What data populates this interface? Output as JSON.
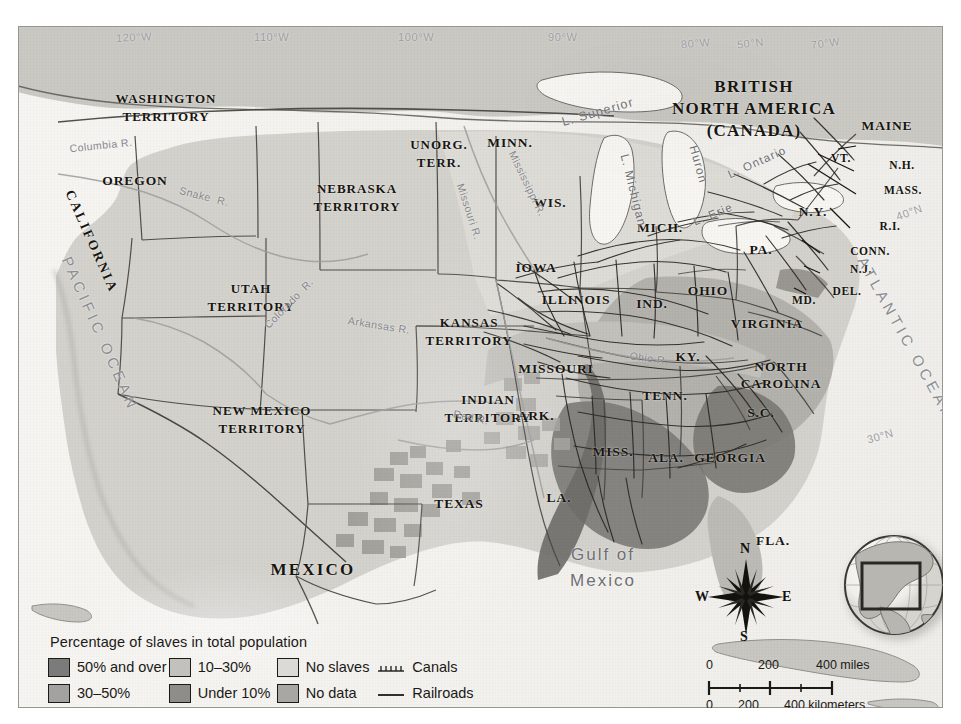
{
  "map": {
    "title": "Percentage of slaves in total population",
    "colors": {
      "over50": "#7b7b7b",
      "p30_50": "#9d9d9d",
      "p10_30": "#b9b9b9",
      "under10": "#8e8e8e",
      "no_slaves": "#d6d5d1",
      "no_data": "#a7a7a7",
      "land": "#cfcdc8",
      "water": "#f4f3f0",
      "ink": "#17150f",
      "border": "#3a3833"
    },
    "regions": [
      {
        "name": "WASHINGTON\nTERRITORY",
        "class": "terr"
      },
      {
        "name": "OREGON",
        "class": "state"
      },
      {
        "name": "CALIFORNIA",
        "class": "state"
      },
      {
        "name": "UTAH\nTERRITORY",
        "class": "terr"
      },
      {
        "name": "NEW MEXICO\nTERRITORY",
        "class": "terr"
      },
      {
        "name": "NEBRASKA\nTERRITORY",
        "class": "terr"
      },
      {
        "name": "KANSAS\nTERRITORY",
        "class": "terr"
      },
      {
        "name": "INDIAN\nTERRITORY",
        "class": "terr"
      },
      {
        "name": "UNORG.\nTERR.",
        "class": "terr"
      },
      {
        "name": "MINN.",
        "class": "state"
      },
      {
        "name": "WIS.",
        "class": "state"
      },
      {
        "name": "IOWA",
        "class": "state"
      },
      {
        "name": "MICH.",
        "class": "state"
      },
      {
        "name": "ILLINOIS",
        "class": "state"
      },
      {
        "name": "IND.",
        "class": "state"
      },
      {
        "name": "OHIO",
        "class": "state"
      },
      {
        "name": "MISSOURI",
        "class": "state"
      },
      {
        "name": "ARK.",
        "class": "state"
      },
      {
        "name": "TEXAS",
        "class": "state"
      },
      {
        "name": "LA.",
        "class": "state"
      },
      {
        "name": "MISS.",
        "class": "state"
      },
      {
        "name": "ALA.",
        "class": "state"
      },
      {
        "name": "GEORGIA",
        "class": "state"
      },
      {
        "name": "FLA.",
        "class": "state"
      },
      {
        "name": "TENN.",
        "class": "state"
      },
      {
        "name": "KY.",
        "class": "state"
      },
      {
        "name": "VIRGINIA",
        "class": "state"
      },
      {
        "name": "NORTH\nCAROLINA",
        "class": "state"
      },
      {
        "name": "S.C.",
        "class": "state"
      },
      {
        "name": "PA.",
        "class": "state"
      },
      {
        "name": "N.Y.",
        "class": "state"
      },
      {
        "name": "MD.",
        "class": "small"
      },
      {
        "name": "DEL.",
        "class": "small"
      },
      {
        "name": "N.J.",
        "class": "small"
      },
      {
        "name": "CONN.",
        "class": "small"
      },
      {
        "name": "R.I.",
        "class": "small"
      },
      {
        "name": "MASS.",
        "class": "small"
      },
      {
        "name": "N.H.",
        "class": "small"
      },
      {
        "name": "VT.",
        "class": "small"
      },
      {
        "name": "MAINE",
        "class": "state"
      },
      {
        "name": "MEXICO",
        "class": "big"
      },
      {
        "name": "BRITISH\nNORTH AMERICA\n(CANADA)",
        "class": "canada"
      }
    ],
    "labels": {
      "washington_territory_l1": "WASHINGTON",
      "washington_territory_l2": "TERRITORY",
      "oregon": "OREGON",
      "california": "CALIFORNIA",
      "utah_l1": "UTAH",
      "utah_l2": "TERRITORY",
      "newmexico_l1": "NEW MEXICO",
      "newmexico_l2": "TERRITORY",
      "nebraska_l1": "NEBRASKA",
      "nebraska_l2": "TERRITORY",
      "kansas_l1": "KANSAS",
      "kansas_l2": "TERRITORY",
      "indian_l1": "INDIAN",
      "indian_l2": "TERRITORY",
      "unorg_l1": "UNORG.",
      "unorg_l2": "TERR.",
      "minn": "MINN.",
      "wis": "WIS.",
      "iowa": "IOWA",
      "mich": "MICH.",
      "illinois": "ILLINOIS",
      "ind": "IND.",
      "ohio": "OHIO",
      "missouri": "MISSOURI",
      "ark": "ARK.",
      "texas": "TEXAS",
      "la": "LA.",
      "miss": "MISS.",
      "ala": "ALA.",
      "georgia": "GEORGIA",
      "fla": "FLA.",
      "tenn": "TENN.",
      "ky": "KY.",
      "virginia": "VIRGINIA",
      "nc_l1": "NORTH",
      "nc_l2": "CAROLINA",
      "sc": "S.C.",
      "pa": "PA.",
      "ny": "N.Y.",
      "md": "MD.",
      "del": "DEL.",
      "nj": "N.J.",
      "conn": "CONN.",
      "ri": "R.I.",
      "mass": "MASS.",
      "nh": "N.H.",
      "vt": "VT.",
      "maine": "MAINE",
      "mexico": "MEXICO",
      "canada_l1": "BRITISH",
      "canada_l2": "NORTH AMERICA",
      "canada_l3": "(CANADA)"
    },
    "water_labels": {
      "pacific": "PACIFIC OCEAN",
      "atlantic": "ATLANTIC OCEAN",
      "gulf_l1": "Gulf of",
      "gulf_l2": "Mexico",
      "l_superior": "L. Superior",
      "l_michigan": "L. Michigan",
      "l_huron": "Huron",
      "l_erie": "L. Erie",
      "l_ontario": "L. Ontario"
    },
    "rivers": {
      "columbia": "Columbia R.",
      "snake": "Snake  R.",
      "colorado": "Colorado  R.",
      "arkansas": "Arkansas R.",
      "missouri": "Missouri R.",
      "mississippi": "Mississippi R.",
      "red": "Red R.",
      "ohio": "Ohio R."
    },
    "graticule": [
      {
        "text": "120°W"
      },
      {
        "text": "110°W"
      },
      {
        "text": "100°W"
      },
      {
        "text": "90°W"
      },
      {
        "text": "80°W"
      },
      {
        "text": "70°W"
      },
      {
        "text": "50°N"
      },
      {
        "text": "40°N"
      },
      {
        "text": "30°N"
      }
    ],
    "graticule_labels": {
      "w120": "120°W",
      "w110": "110°W",
      "w100": "100°W",
      "w90": "90°W",
      "w80": "80°W",
      "w70": "70°W",
      "n50": "50°N",
      "n40": "40°N",
      "n30": "30°N"
    }
  },
  "legend": {
    "title": "Percentage of slaves in total population",
    "items": [
      {
        "label": "50% and over",
        "color": "#7b7b7b",
        "icon": "swatch-50-and-over"
      },
      {
        "label": "30–50%",
        "color": "#9d9d9d",
        "icon": "swatch-30-50"
      },
      {
        "label": "10–30%",
        "color": "#c0bfbb",
        "icon": "swatch-10-30"
      },
      {
        "label": "Under 10%",
        "color": "#8e8e8e",
        "icon": "swatch-under-10"
      },
      {
        "label": "No slaves",
        "color": "#d9d8d4",
        "icon": "swatch-no-slaves"
      },
      {
        "label": "No data",
        "color": "#a7a7a7",
        "icon": "swatch-no-data"
      }
    ],
    "lines": [
      {
        "label": "Canals",
        "icon": "canal-line"
      },
      {
        "label": "Railroads",
        "icon": "railroad-line"
      }
    ]
  },
  "scale": {
    "miles": {
      "ticks": [
        "0",
        "200",
        "400"
      ],
      "unit": "miles"
    },
    "kilometers": {
      "ticks": [
        "0",
        "200",
        "400"
      ],
      "unit": "kilometers"
    },
    "miles_label": "400 miles",
    "km_label": "400 kilometers"
  },
  "compass": {
    "north": "N",
    "east": "E",
    "south": "S",
    "west": "W"
  },
  "inset": {
    "name": "north-america-locator-globe"
  }
}
